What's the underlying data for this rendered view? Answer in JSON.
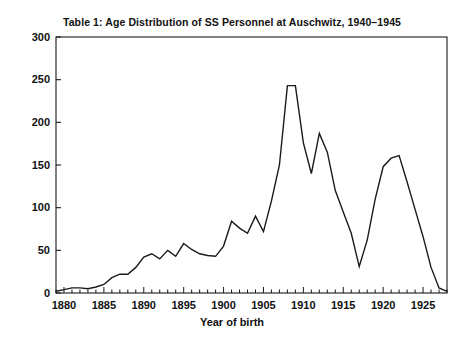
{
  "chart_data": {
    "type": "line",
    "title": "Table 1:  Age Distribution of SS Personnel at Auschwitz, 1940–1945",
    "xlabel": "Year of birth",
    "ylabel": "",
    "xlim": [
      1879,
      1928
    ],
    "ylim": [
      0,
      300
    ],
    "grid": false,
    "legend": null,
    "x_ticks_major": [
      1880,
      1885,
      1890,
      1895,
      1900,
      1905,
      1910,
      1915,
      1920,
      1925
    ],
    "x_tick_labels": [
      "1880",
      "1885",
      "1890",
      "1895",
      "1900",
      "1905",
      "1910",
      "1915",
      "1920",
      "1925"
    ],
    "x_minor_tick_interval": 1,
    "y_ticks": [
      0,
      50,
      100,
      150,
      200,
      250,
      300
    ],
    "y_tick_labels": [
      "0",
      "50",
      "100",
      "150",
      "200",
      "250",
      "300"
    ],
    "line_color": "#1a1a1a",
    "line_width": 1.4,
    "series_name": "SS personnel",
    "x": [
      1879,
      1880,
      1881,
      1882,
      1883,
      1884,
      1885,
      1886,
      1887,
      1888,
      1889,
      1890,
      1891,
      1892,
      1893,
      1894,
      1895,
      1896,
      1897,
      1898,
      1899,
      1900,
      1901,
      1902,
      1903,
      1904,
      1905,
      1906,
      1907,
      1908,
      1909,
      1910,
      1911,
      1912,
      1913,
      1914,
      1915,
      1916,
      1917,
      1918,
      1919,
      1920,
      1921,
      1922,
      1923,
      1924,
      1925,
      1926,
      1927,
      1928
    ],
    "values": [
      2,
      4,
      6,
      6,
      5,
      7,
      10,
      18,
      22,
      22,
      30,
      42,
      46,
      40,
      50,
      43,
      58,
      51,
      46,
      44,
      43,
      55,
      84,
      76,
      70,
      90,
      72,
      108,
      150,
      243,
      243,
      176,
      140,
      187,
      165,
      120,
      95,
      70,
      31,
      62,
      110,
      148,
      158,
      161,
      130,
      98,
      66,
      30,
      6,
      2
    ]
  }
}
